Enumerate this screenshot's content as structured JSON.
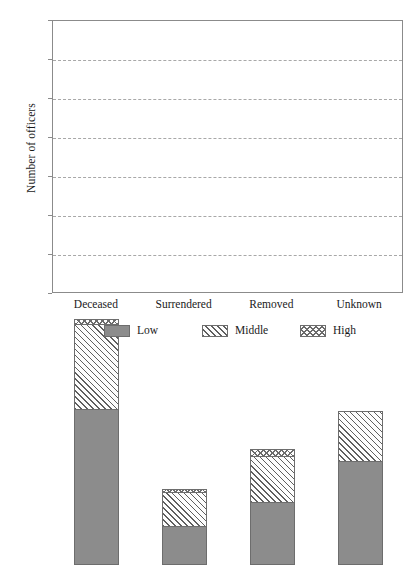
{
  "chart_data": {
    "type": "bar",
    "subtype": "stacked-bar",
    "title": "",
    "xlabel": "",
    "ylabel": "Number of officers",
    "ylim": [
      0,
      700
    ],
    "ytick_step": 100,
    "yticks": [
      0,
      100,
      200,
      300,
      400,
      500,
      600,
      700
    ],
    "ytick_labels": [
      "0",
      "100",
      "200",
      "300",
      "400",
      "500",
      "600",
      "700"
    ],
    "categories": [
      "Deceased",
      "Surrendered",
      "Removed",
      "Unknown"
    ],
    "grid": true,
    "grid_axis": "y",
    "grid_style": "dashed",
    "legend_position": "bottom",
    "series": [
      {
        "name": "Low",
        "pattern": "solid-gray",
        "color": "#8c8c8c",
        "values": [
          400,
          100,
          162,
          267
        ]
      },
      {
        "name": "Middle",
        "pattern": "diagonal-hatch",
        "color": "#ffffff",
        "values": [
          218,
          88,
          118,
          129
        ]
      },
      {
        "name": "High",
        "pattern": "crosshatch",
        "color": "#ffffff",
        "values": [
          12,
          7,
          18,
          0
        ]
      }
    ],
    "totals": [
      630,
      195,
      298,
      396
    ],
    "annotations": []
  },
  "legend": {
    "entries": [
      {
        "label": "Low"
      },
      {
        "label": "Middle"
      },
      {
        "label": "High"
      }
    ]
  },
  "colors": {
    "low": "#8c8c8c",
    "hatch_line": "#5f5f5f",
    "frame": "#8b8b8b",
    "grid": "#9a9a9a",
    "background": "#ffffff",
    "text": "#1a1a1a"
  }
}
